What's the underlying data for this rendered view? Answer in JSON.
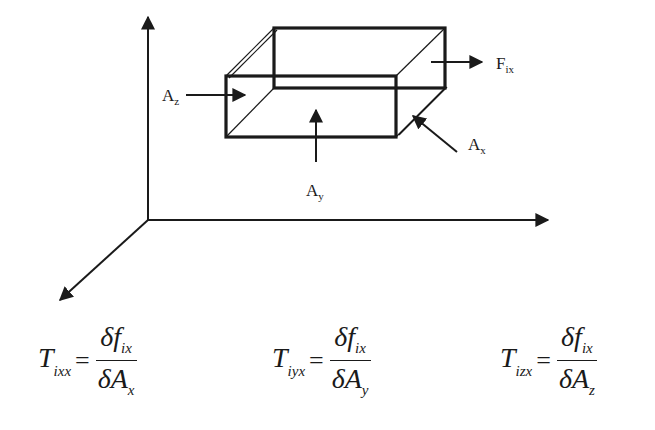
{
  "figure": {
    "type": "stress-element-diagram",
    "colors": {
      "ink": "#1a1a1a",
      "background": "#ffffff"
    },
    "axes": {
      "origin": [
        148,
        220
      ],
      "vertical_end": [
        148,
        15
      ],
      "horizontal_end": [
        550,
        220
      ],
      "diagonal_end": [
        58,
        302
      ]
    },
    "labels": {
      "az": {
        "base": "A",
        "sub": "z"
      },
      "ay": {
        "base": "A",
        "sub": "y"
      },
      "ax": {
        "base": "A",
        "sub": "x"
      },
      "fix": {
        "base": "F",
        "sub": "ix"
      }
    }
  },
  "equations": [
    {
      "lhs_base": "T",
      "lhs_sub": "ixx",
      "equals": "=",
      "num_base": "δf",
      "num_sub": "ix",
      "den_base": "δA",
      "den_sub": "x"
    },
    {
      "lhs_base": "T",
      "lhs_sub": "iyx",
      "equals": "=",
      "num_base": "δf",
      "num_sub": "ix",
      "den_base": "δA",
      "den_sub": "y"
    },
    {
      "lhs_base": "T",
      "lhs_sub": "izx",
      "equals": "=",
      "num_base": "δf",
      "num_sub": "ix",
      "den_base": "δA",
      "den_sub": "z"
    }
  ]
}
